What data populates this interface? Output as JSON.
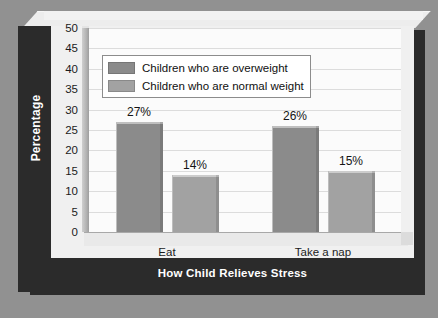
{
  "chart_data": {
    "type": "bar",
    "title": "",
    "subtitle": "",
    "xlabel": "How Child Relieves Stress",
    "ylabel": "Percentage",
    "categories": [
      "Eat",
      "Take a nap"
    ],
    "series": [
      {
        "name": "Children who are overweight",
        "color": "#8b8b8b",
        "values": [
          27,
          26
        ],
        "data_labels": [
          "27%",
          "26%"
        ]
      },
      {
        "name": "Children who are normal weight",
        "color": "#a2a2a2",
        "values": [
          14,
          15
        ],
        "data_labels": [
          "14%",
          "15%"
        ]
      }
    ],
    "ylim": [
      0,
      50
    ],
    "ytick_step": 5,
    "ytick_labels": [
      "50",
      "45",
      "40",
      "35",
      "30",
      "25",
      "20",
      "15",
      "10",
      "5",
      "0"
    ],
    "grid": true,
    "legend_position": "top-center",
    "value_suffix": "%"
  },
  "colors": {
    "page_background": "#919191",
    "card_background": "#f4f4f4",
    "plot_background": "#fbfbfb",
    "band_dark": "#2b2b2b",
    "gridline": "#dcdcdc",
    "series_overweight": "#8b8b8b",
    "series_normal": "#a2a2a2",
    "text_dark": "#1b1b1b",
    "text_light": "#ffffff"
  }
}
